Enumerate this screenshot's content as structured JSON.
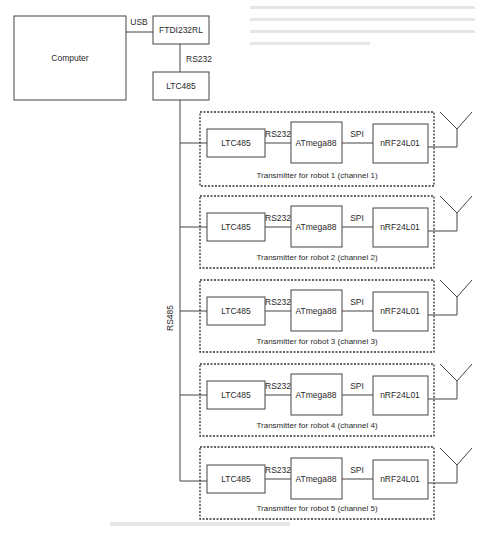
{
  "diagram": {
    "type": "block-diagram",
    "top": {
      "computer": {
        "label": "Computer"
      },
      "usb_link": {
        "label": "USB"
      },
      "ftdi": {
        "label": "FTDI232RL"
      },
      "rs232_link": {
        "label": "RS232"
      },
      "ltc485_master": {
        "label": "LTC485"
      },
      "bus": {
        "label": "RS485"
      }
    },
    "transmitters": [
      {
        "caption": "Transmitter for robot 1 (channel 1)",
        "ltc": "LTC485",
        "link1": "RS232",
        "mcu": "ATmega88",
        "link2": "SPI",
        "radio": "nRF24L01"
      },
      {
        "caption": "Transmitter for robot 2 (channel 2)",
        "ltc": "LTC485",
        "link1": "RS232",
        "mcu": "ATmega88",
        "link2": "SPI",
        "radio": "nRF24L01"
      },
      {
        "caption": "Transmitter for robot 3 (channel 3)",
        "ltc": "LTC485",
        "link1": "RS232",
        "mcu": "ATmega88",
        "link2": "SPI",
        "radio": "nRF24L01"
      },
      {
        "caption": "Transmitter for robot 4 (channel 4)",
        "ltc": "LTC485",
        "link1": "RS232",
        "mcu": "ATmega88",
        "link2": "SPI",
        "radio": "nRF24L01"
      },
      {
        "caption": "Transmitter for robot 5 (channel 5)",
        "ltc": "LTC485",
        "link1": "RS232",
        "mcu": "ATmega88",
        "link2": "SPI",
        "radio": "nRF24L01"
      }
    ],
    "icons": {
      "antenna": "antenna-icon"
    },
    "colors": {
      "line": "#444444",
      "background": "#ffffff",
      "text": "#2a2a2a"
    }
  }
}
